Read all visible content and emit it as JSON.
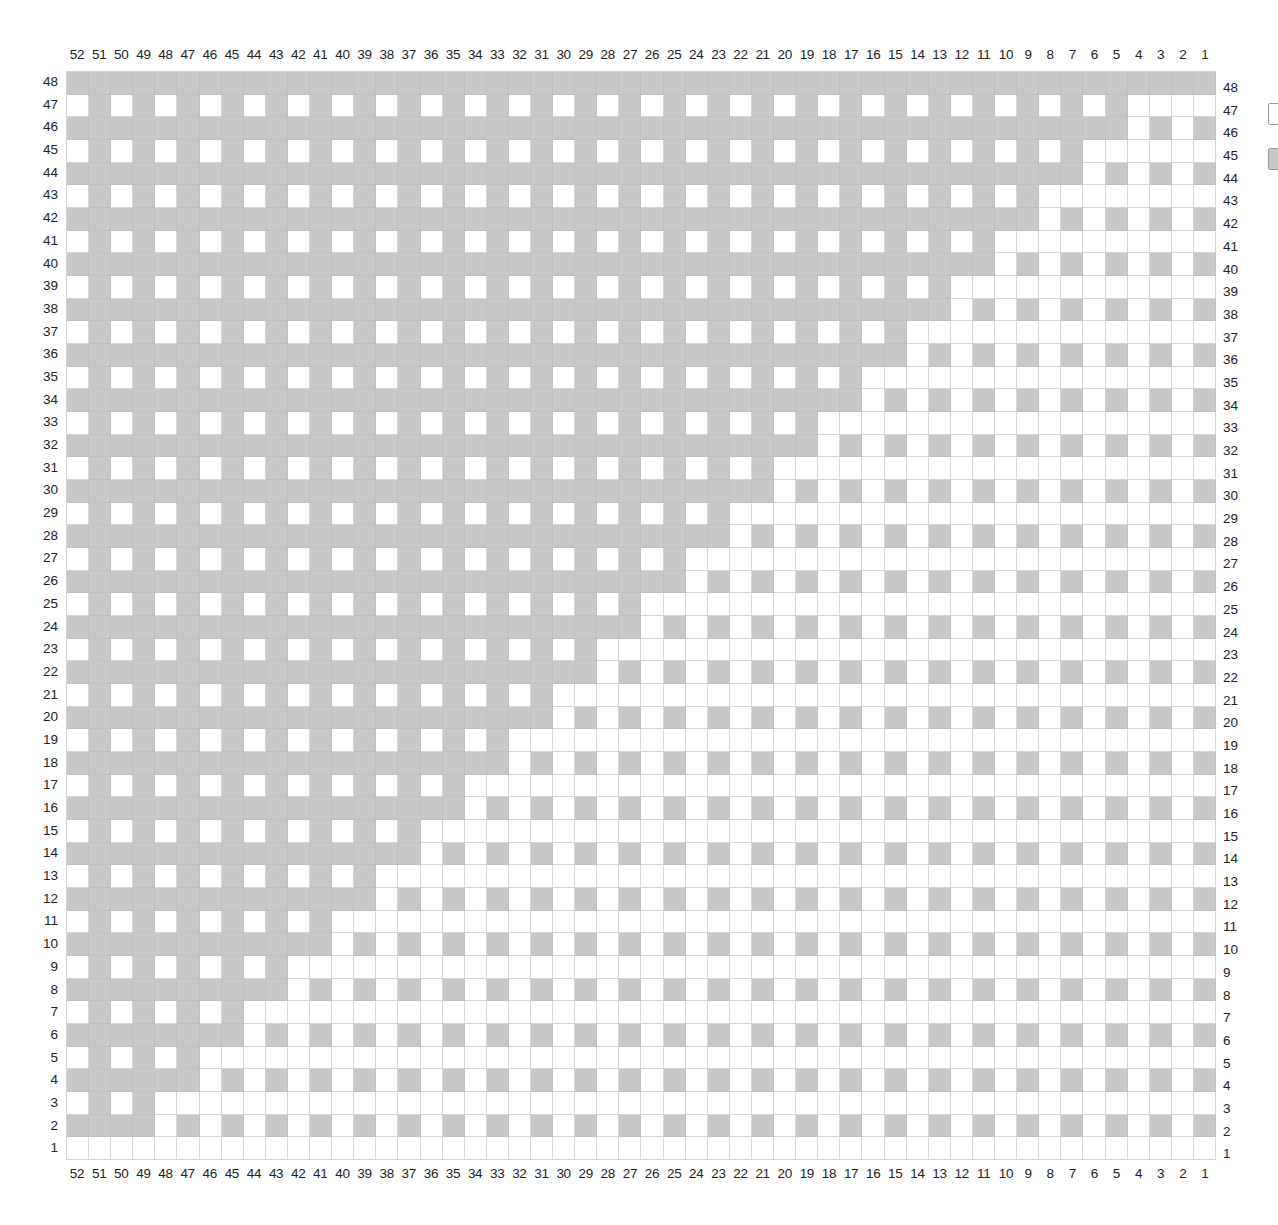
{
  "chart_data": {
    "type": "heatmap",
    "title": "",
    "columns": 52,
    "rows": 48,
    "column_labels_left_to_right": [
      52,
      51,
      50,
      49,
      48,
      47,
      46,
      45,
      44,
      43,
      42,
      41,
      40,
      39,
      38,
      37,
      36,
      35,
      34,
      33,
      32,
      31,
      30,
      29,
      28,
      27,
      26,
      25,
      24,
      23,
      22,
      21,
      20,
      19,
      18,
      17,
      16,
      15,
      14,
      13,
      12,
      11,
      10,
      9,
      8,
      7,
      6,
      5,
      4,
      3,
      2,
      1
    ],
    "row_labels_top_to_bottom": [
      48,
      47,
      46,
      45,
      44,
      43,
      42,
      41,
      40,
      39,
      38,
      37,
      36,
      35,
      34,
      33,
      32,
      31,
      30,
      29,
      28,
      27,
      26,
      25,
      24,
      23,
      22,
      21,
      20,
      19,
      18,
      17,
      16,
      15,
      14,
      13,
      12,
      11,
      10,
      9,
      8,
      7,
      6,
      5,
      4,
      3,
      2,
      1
    ],
    "colors": {
      "0": "#ffffff",
      "1": "#c8c8c8",
      "grid": "#d6d6d6"
    },
    "legend": [
      {
        "key": "0",
        "color": "#ffffff",
        "label": ""
      },
      {
        "key": "1",
        "color": "#c8c8c8",
        "label": ""
      }
    ],
    "rule": {
      "row_1": "all white",
      "row_48": "all gray",
      "even_rows": "solid gray for columns >= (51 - row); remaining columns gray on odd column numbers, white on even",
      "odd_rows": "for columns >= (52 - row): gray on odd column numbers, white on even; remaining columns all white"
    },
    "row_solid_extent": {
      "2": 49,
      "4": 47,
      "6": 45,
      "8": 43,
      "10": 41,
      "12": 39,
      "14": 37,
      "16": 35,
      "18": 33,
      "20": 31,
      "22": 29,
      "24": 27,
      "26": 25,
      "28": 23,
      "30": 21,
      "32": 19,
      "34": 17,
      "36": 15,
      "38": 13,
      "40": 11,
      "42": 9,
      "44": 7,
      "46": 5,
      "48": 1
    },
    "row_checker_extent": {
      "3": 49,
      "5": 47,
      "7": 45,
      "9": 43,
      "11": 41,
      "13": 39,
      "15": 37,
      "17": 35,
      "19": 33,
      "21": 31,
      "23": 29,
      "25": 27,
      "27": 25,
      "29": 23,
      "31": 21,
      "33": 19,
      "35": 17,
      "37": 15,
      "39": 13,
      "41": 11,
      "43": 9,
      "45": 7,
      "47": 5
    }
  }
}
